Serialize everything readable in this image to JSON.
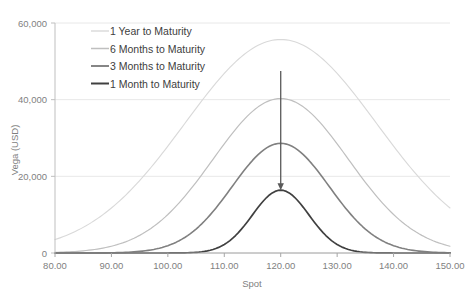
{
  "chart_data": {
    "type": "line",
    "title": "",
    "xlabel": "Spot",
    "ylabel": "Vega (USD)",
    "xlim": [
      80,
      150
    ],
    "ylim": [
      0,
      60000
    ],
    "xticks": [
      80,
      90,
      100,
      110,
      120,
      130,
      140,
      150
    ],
    "xticklabels": [
      "80.00",
      "90.00",
      "100.00",
      "110.00",
      "120.00",
      "130.00",
      "140.00",
      "150.00"
    ],
    "yticks": [
      0,
      20000,
      40000,
      60000
    ],
    "yticklabels": [
      "0",
      "20,000",
      "40,000",
      "60,000"
    ],
    "grid": "horizontal",
    "legend_position": "upper-left-inside",
    "peak_x": 120,
    "series": [
      {
        "name": "1 Year to Maturity",
        "color": "#d9d9d9",
        "width": 1.1,
        "peak": 55700,
        "sigma": 17.0,
        "x": [
          80,
          82,
          84,
          86,
          88,
          90,
          92,
          94,
          96,
          98,
          100,
          102,
          104,
          106,
          108,
          110,
          112,
          114,
          116,
          118,
          120,
          122,
          124,
          126,
          128,
          130,
          132,
          134,
          136,
          138,
          140,
          142,
          144,
          146,
          148,
          150
        ],
        "values": [
          11900,
          14000,
          16300,
          18800,
          21400,
          24200,
          27000,
          29900,
          32800,
          35700,
          38600,
          41300,
          43900,
          46300,
          48400,
          50300,
          51900,
          53200,
          54200,
          54900,
          55700,
          54900,
          54200,
          53200,
          51900,
          50300,
          48400,
          46300,
          43900,
          41300,
          38600,
          35700,
          32800,
          29900,
          27000,
          24200
        ]
      },
      {
        "name": "6 Months to Maturity",
        "color": "#bfbfbf",
        "width": 1.2,
        "peak": 40300,
        "sigma": 12.0,
        "x": [
          80,
          82,
          84,
          86,
          88,
          90,
          92,
          94,
          96,
          98,
          100,
          102,
          104,
          106,
          108,
          110,
          112,
          114,
          116,
          118,
          120,
          122,
          124,
          126,
          128,
          130,
          132,
          134,
          136,
          138,
          140,
          142,
          144,
          146,
          148,
          150
        ],
        "values": [
          1800,
          2700,
          3900,
          5500,
          7500,
          9900,
          12700,
          15800,
          19000,
          22400,
          25700,
          28800,
          31700,
          34200,
          36400,
          38100,
          39300,
          40000,
          40300,
          40300,
          40300,
          40300,
          40300,
          40000,
          39300,
          38100,
          36400,
          34200,
          31700,
          28800,
          25700,
          22400,
          19000,
          15800,
          12700,
          9900
        ]
      },
      {
        "name": "3 Months to Maturity",
        "color": "#808080",
        "width": 1.6,
        "peak": 28600,
        "sigma": 8.6,
        "x": [
          80,
          82,
          84,
          86,
          88,
          90,
          92,
          94,
          96,
          98,
          100,
          102,
          104,
          106,
          108,
          110,
          112,
          114,
          116,
          118,
          120,
          122,
          124,
          126,
          128,
          130,
          132,
          134,
          136,
          138,
          140,
          142,
          144,
          146,
          148,
          150
        ],
        "values": [
          60,
          130,
          280,
          560,
          1060,
          1900,
          3200,
          5100,
          7600,
          10700,
          14100,
          17700,
          21100,
          24000,
          26300,
          27800,
          28500,
          28600,
          28600,
          28600,
          28600,
          28600,
          28600,
          28500,
          27800,
          26300,
          24000,
          21100,
          17700,
          14100,
          10700,
          7600,
          5100,
          3200,
          1900,
          1060
        ]
      },
      {
        "name": "1 Month to Maturity",
        "color": "#404040",
        "width": 1.7,
        "peak": 16400,
        "sigma": 5.0,
        "x": [
          80,
          82,
          84,
          86,
          88,
          90,
          92,
          94,
          96,
          98,
          100,
          102,
          104,
          106,
          108,
          110,
          112,
          114,
          116,
          118,
          120,
          122,
          124,
          126,
          128,
          130,
          132,
          134,
          136,
          138,
          140,
          142,
          144,
          146,
          148,
          150
        ],
        "values": [
          0,
          0,
          0,
          0,
          0,
          0,
          5,
          20,
          80,
          260,
          700,
          1700,
          3500,
          6200,
          9600,
          12900,
          15300,
          16300,
          16400,
          16400,
          16400,
          16400,
          16400,
          16300,
          15300,
          12900,
          9600,
          6200,
          3500,
          1700,
          700,
          260,
          80,
          20,
          5,
          0
        ]
      }
    ],
    "annotation": {
      "type": "down-arrow",
      "x": 120,
      "y_start": 47500,
      "y_end": 16400,
      "color": "#595959"
    }
  },
  "legend": {
    "items": [
      {
        "label": "1 Year to Maturity"
      },
      {
        "label": "6 Months to Maturity"
      },
      {
        "label": "3 Months to Maturity"
      },
      {
        "label": "1 Month to Maturity"
      }
    ]
  },
  "axes": {
    "y_title": "Vega (USD)",
    "x_title": "Spot",
    "y_labels": [
      "60,000",
      "40,000",
      "20,000",
      "0"
    ],
    "x_labels": [
      "80.00",
      "90.00",
      "100.00",
      "110.00",
      "120.00",
      "130.00",
      "140.00",
      "150.00"
    ]
  }
}
